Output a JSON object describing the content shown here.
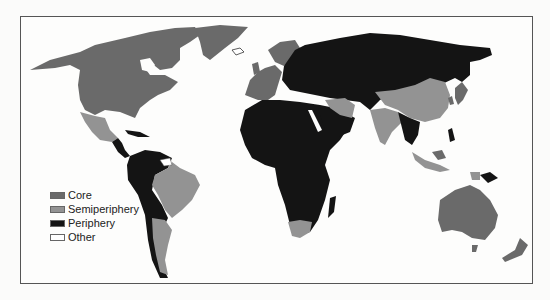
{
  "map": {
    "title": "World-system: core, semiperiphery, periphery",
    "colors": {
      "core": "#6a6a6a",
      "semiperiphery": "#939393",
      "periphery": "#141414",
      "other": "#ffffff",
      "ocean": "#fdfdfc"
    }
  },
  "legend": {
    "items": [
      {
        "key": "core",
        "label": "Core",
        "color": "#6a6a6a"
      },
      {
        "key": "semiperiphery",
        "label": "Semiperiphery",
        "color": "#939393"
      },
      {
        "key": "periphery",
        "label": "Periphery",
        "color": "#141414"
      },
      {
        "key": "other",
        "label": "Other",
        "color": "#ffffff"
      }
    ]
  }
}
